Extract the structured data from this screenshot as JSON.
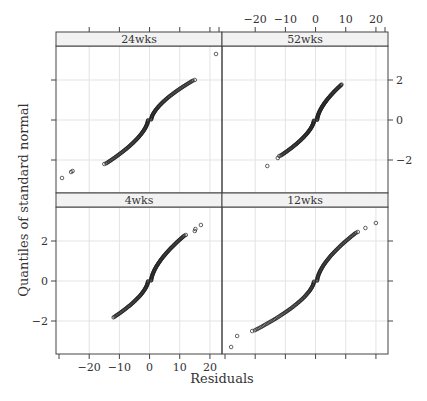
{
  "chart_data": {
    "type": "scatter",
    "subtype": "qq-plot",
    "title": "",
    "xlabel": "Residuals",
    "ylabel": "Quantiles of standard normal",
    "xlim": [
      -31,
      24
    ],
    "ylim": [
      -3.65,
      3.7
    ],
    "x_ticks": [
      -20,
      -10,
      0,
      10,
      20
    ],
    "y_ticks": [
      -2,
      0,
      2
    ],
    "grid": true,
    "legend": null,
    "layout": "2x2 trellis",
    "panels": [
      {
        "name": "24wks",
        "position": "top-left",
        "points_summary": {
          "min_residual": -29,
          "max_residual": 22,
          "min_q": -2.9,
          "max_q": 3.3,
          "outliers": [
            [
              -29,
              -2.9
            ],
            [
              -26,
              -2.6
            ],
            [
              -25.5,
              -2.55
            ],
            [
              -15,
              -2.2
            ],
            [
              15,
              2.0
            ],
            [
              22,
              3.3
            ]
          ]
        }
      },
      {
        "name": "52wks",
        "position": "top-right",
        "points_summary": {
          "min_residual": -16,
          "max_residual": 9,
          "min_q": -2.3,
          "max_q": 1.8,
          "outliers": [
            [
              -16,
              -2.3
            ],
            [
              -12.5,
              -1.9
            ],
            [
              -12,
              -1.8
            ]
          ]
        }
      },
      {
        "name": "4wks",
        "position": "bottom-left",
        "points_summary": {
          "min_residual": -12.5,
          "max_residual": 17,
          "min_q": -1.85,
          "max_q": 2.8,
          "outliers": [
            [
              12,
              2.3
            ],
            [
              15,
              2.5
            ],
            [
              15.2,
              2.6
            ],
            [
              17,
              2.8
            ]
          ]
        }
      },
      {
        "name": "12wks",
        "position": "bottom-right",
        "points_summary": {
          "min_residual": -28,
          "max_residual": 20,
          "min_q": -3.3,
          "max_q": 2.9,
          "outliers": [
            [
              -28,
              -3.3
            ],
            [
              -26,
              -2.75
            ],
            [
              -21,
              -2.5
            ],
            [
              14,
              2.45
            ],
            [
              16.5,
              2.65
            ],
            [
              20,
              2.9
            ]
          ]
        }
      }
    ]
  },
  "labels": {
    "xlabel": "Residuals",
    "ylabel": "Quantiles of standard normal",
    "strips": [
      "24wks",
      "52wks",
      "4wks",
      "12wks"
    ],
    "x_ticks": [
      "−20",
      "−10",
      "0",
      "10",
      "20"
    ],
    "y_ticks": [
      "2",
      "0",
      "−2"
    ]
  }
}
